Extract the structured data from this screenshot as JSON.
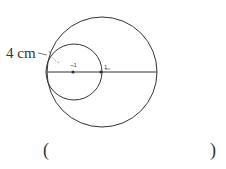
{
  "diagram": {
    "radius_label": "4 cm",
    "point_label_small_center": "¬1",
    "point_label_big_center": "1",
    "big_circle": {
      "cx": 102,
      "cy": 72,
      "r": 55
    },
    "small_circle": {
      "cx": 74,
      "cy": 72,
      "r": 28
    },
    "stroke_color": "#333333"
  },
  "answer": {
    "open_paren": "(",
    "close_paren": ")",
    "value": ""
  }
}
